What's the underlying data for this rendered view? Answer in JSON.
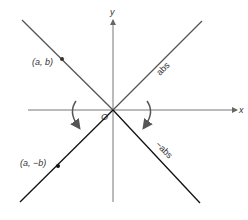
{
  "diagram": {
    "axes": {
      "x_label": "x",
      "y_label": "y",
      "origin_label": "O"
    },
    "lines": [
      {
        "name": "abs-upper-left",
        "color": "#555555"
      },
      {
        "name": "abs-upper-right",
        "color": "#555555",
        "label": "abs"
      },
      {
        "name": "neg-abs-lower-left",
        "color": "#111111"
      },
      {
        "name": "neg-abs-lower-right",
        "color": "#111111",
        "label": "−abs"
      }
    ],
    "points": [
      {
        "label": "(a, b)"
      },
      {
        "label": "(a, −b)"
      }
    ],
    "colors": {
      "axis": "#777777",
      "upper_lines": "#555555",
      "lower_lines": "#111111",
      "arrows": "#555555",
      "text": "#333333"
    }
  }
}
